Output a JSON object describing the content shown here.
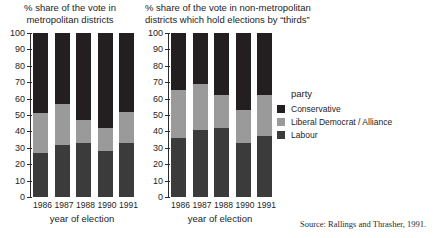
{
  "chart_data": [
    {
      "type": "bar",
      "subtype": "stacked-100",
      "title": "% share of the vote in\nmetropolitan districts",
      "xlabel": "year of election",
      "ylabel": "",
      "ylim": [
        0,
        100
      ],
      "yticks": [
        0,
        10,
        20,
        30,
        40,
        50,
        60,
        70,
        80,
        90,
        100
      ],
      "grid": false,
      "categories": [
        "1986",
        "1987",
        "1988",
        "1990",
        "1991"
      ],
      "series": [
        {
          "name": "Labour",
          "values": [
            27,
            32,
            33,
            28,
            33
          ]
        },
        {
          "name": "Liberal Democrat / Alliance",
          "values": [
            24,
            25,
            14,
            14,
            19
          ]
        },
        {
          "name": "Conservative",
          "values": [
            49,
            43,
            53,
            58,
            48
          ]
        }
      ],
      "cumulative_tops": {
        "Labour": [
          27,
          32,
          33,
          28,
          33
        ],
        "Liberal Democrat / Alliance": [
          51,
          57,
          47,
          42,
          52
        ],
        "Conservative": [
          100,
          100,
          100,
          100,
          100
        ]
      }
    },
    {
      "type": "bar",
      "subtype": "stacked-100",
      "title": "% share of the vote in non-metropolitan\ndistricts which hold elections by “thirds”",
      "xlabel": "year of election",
      "ylabel": "",
      "ylim": [
        0,
        100
      ],
      "yticks": [
        0,
        10,
        20,
        30,
        40,
        50,
        60,
        70,
        80,
        90,
        100
      ],
      "grid": false,
      "categories": [
        "1986",
        "1987",
        "1988",
        "1990",
        "1991"
      ],
      "series": [
        {
          "name": "Labour",
          "values": [
            36,
            41,
            42,
            33,
            37
          ]
        },
        {
          "name": "Liberal Democrat / Alliance",
          "values": [
            29,
            28,
            20,
            20,
            25
          ]
        },
        {
          "name": "Conservative",
          "values": [
            35,
            31,
            38,
            47,
            38
          ]
        }
      ],
      "cumulative_tops": {
        "Labour": [
          36,
          41,
          42,
          33,
          37
        ],
        "Liberal Democrat / Alliance": [
          65,
          69,
          62,
          53,
          62
        ],
        "Conservative": [
          100,
          100,
          100,
          100,
          100
        ]
      }
    }
  ],
  "panels": {
    "left": {
      "title": "% share of the vote in\nmetropolitan districts",
      "axis_title": "year of election"
    },
    "right": {
      "title": "% share of the vote in non-metropolitan\ndistricts which hold elections by “thirds”",
      "axis_title": "year of election"
    }
  },
  "yticks": [
    "100",
    "90",
    "80",
    "70",
    "60",
    "50",
    "40",
    "30",
    "20",
    "10",
    "0"
  ],
  "legend": {
    "title": "party",
    "position": "right",
    "entries": [
      {
        "label": "Conservative",
        "color": "#231f20"
      },
      {
        "label": "Liberal Democrat / Alliance",
        "color": "#9a9a9a"
      },
      {
        "label": "Labour",
        "color": "#3b3b3b"
      }
    ]
  },
  "colors": {
    "conservative": "#231f20",
    "liberal_democrat_alliance": "#9a9a9a",
    "labour": "#3b3b3b",
    "axis": "#2b2b2b",
    "text": "#242424",
    "background": "#ffffff"
  },
  "source": "Source: Rallings and Thrasher, 1991."
}
